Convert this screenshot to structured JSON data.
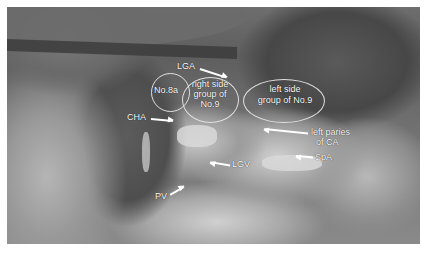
{
  "figure": {
    "type": "laparoscopic surgical photograph (grayscale)",
    "labels": {
      "no8a": "No.8a",
      "right_side_line1": "right side",
      "right_side_line2": "group of",
      "right_side_line3": "No.9",
      "left_side_line1": "left side",
      "left_side_line2": "group of No.9",
      "lga": "LGA",
      "cha": "CHA",
      "left_paries_line1": "left paries",
      "left_paries_line2": "of CA",
      "spa": "SpA",
      "lgv": "LGV",
      "pv": "PV"
    }
  }
}
